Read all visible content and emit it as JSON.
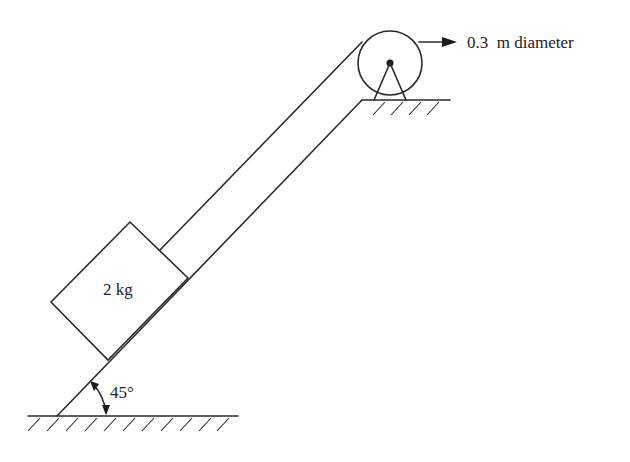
{
  "diagram": {
    "type": "inclined plane with pulley",
    "block": {
      "label": "2 kg"
    },
    "incline": {
      "angle_label": "45°"
    },
    "pulley": {
      "label": "0.3  m diameter"
    },
    "colors": {
      "stroke": "#2a2a2a",
      "background": "#ffffff"
    }
  }
}
